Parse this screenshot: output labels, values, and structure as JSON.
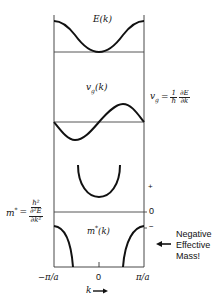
{
  "diagram": {
    "panels": {
      "energy": {
        "label": "E(k)"
      },
      "group_velocity": {
        "label": "v_g(k)",
        "label_main": "v",
        "label_sub": "g",
        "label_tail": "(k)"
      },
      "effective_mass": {
        "label": "m*(k)",
        "label_main": "m",
        "label_sup": "*",
        "label_tail": "(k)"
      }
    },
    "equations": {
      "group_velocity": {
        "lhs_main": "v",
        "lhs_sub": "g",
        "equals": "=",
        "frac1_num": "1",
        "frac1_den": "ħ",
        "frac2_num": "∂E",
        "frac2_den": "∂k"
      },
      "effective_mass": {
        "lhs_main": "m",
        "lhs_sup": "*",
        "equals": "=",
        "num": "ħ²",
        "den_top": "∂²E",
        "den_bottom": "∂k²"
      }
    },
    "sign_markers": {
      "plus": "+",
      "zero": "0",
      "minus": "−"
    },
    "x_axis": {
      "ticks": [
        "−π/a",
        "0",
        "π/a"
      ],
      "label": "k",
      "arrow": "→"
    },
    "annotation": {
      "lines": [
        "Negative",
        "Effective",
        "Mass!"
      ],
      "arrow": "←"
    },
    "colors": {
      "line": "#111111",
      "background": "#ffffff"
    }
  }
}
